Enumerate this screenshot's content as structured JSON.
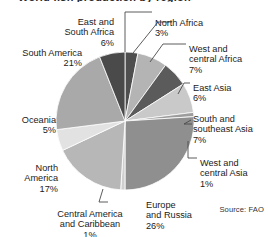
{
  "figure": {
    "cropped_title_fragment": "World fish production by region",
    "source_note": "Source: FAO"
  },
  "chart_data": {
    "type": "pie",
    "title": "",
    "xlabel": "",
    "ylabel": "",
    "legend_position": "callout-labels",
    "grid": false,
    "start_angle_deg": 0,
    "direction": "clockwise",
    "units": "percent",
    "categories": [
      "North Africa",
      "West and central Africa",
      "East Asia",
      "South and southeast Asia",
      "West and central Asia",
      "Europe and Russia",
      "Central America and Caribbean",
      "North America",
      "Oceania",
      "South America",
      "East and South Africa"
    ],
    "values": [
      3,
      7,
      6,
      7,
      1,
      26,
      1,
      17,
      5,
      21,
      6
    ],
    "colors": [
      "#4f4f4f",
      "#b4b4b4",
      "#5b5b5b",
      "#c9c9c9",
      "#9d9d9d",
      "#8f8f8f",
      "#cfcfcf",
      "#b7b7b7",
      "#e2e2e2",
      "#a9a9a9",
      "#4a4a4a"
    ]
  },
  "labels": [
    {
      "id": "east-and-south-africa",
      "name": "East and\nSouth Africa",
      "pct": "6%"
    },
    {
      "id": "north-africa",
      "name": "North Africa",
      "pct": "3%"
    },
    {
      "id": "west-and-central-africa",
      "name": "West and\ncentral Africa",
      "pct": "7%"
    },
    {
      "id": "east-asia",
      "name": "East Asia",
      "pct": "6%"
    },
    {
      "id": "south-and-southeast-asia",
      "name": "South and\nsoutheast Asia",
      "pct": "7%"
    },
    {
      "id": "west-and-central-asia",
      "name": "West and\ncentral Asia",
      "pct": "1%"
    },
    {
      "id": "europe-and-russia",
      "name": "Europe\nand Russia",
      "pct": "26%"
    },
    {
      "id": "central-america-and-caribbean",
      "name": "Central America\nand Caribbean",
      "pct": "1%"
    },
    {
      "id": "north-america",
      "name": "North\nAmerica",
      "pct": "17%"
    },
    {
      "id": "oceania",
      "name": "Oceania",
      "pct": "5%"
    },
    {
      "id": "south-america",
      "name": "South America",
      "pct": "21%"
    }
  ]
}
